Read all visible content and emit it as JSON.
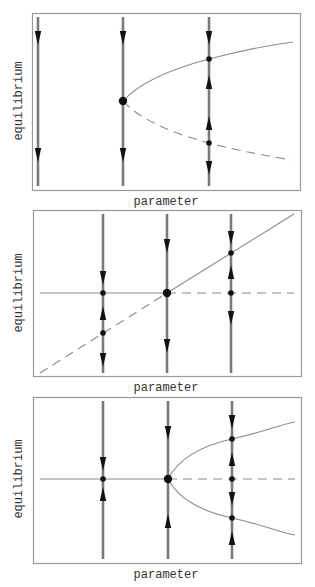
{
  "figure": {
    "colors": {
      "frame": "#9a9a9a",
      "branch": "#8c8c8c",
      "phase_line": "#7a7a7a",
      "arrow": "#111111",
      "dot": "#111111",
      "text": "#333333"
    }
  },
  "panels": [
    {
      "name": "saddle-node",
      "xlabel": "parameter",
      "ylabel": "equilibrium",
      "frame": {
        "x": 32,
        "y": 13,
        "w": 268,
        "h": 177
      },
      "xlabel_pos": {
        "x": 166,
        "y": 205
      },
      "ylabel_pos": {
        "x": 22,
        "y": 101
      },
      "stable_branches": [
        {
          "type": "path",
          "d": "M123,101 C140,82 175,68 209,59 S270,45 293,42"
        }
      ],
      "unstable_branches": [
        {
          "type": "path",
          "d": "M123,101 C140,120 175,134 209,143 S270,156 291,160"
        }
      ],
      "phase_lines": [
        {
          "x": 38,
          "y1": 17,
          "y2": 186,
          "arrows": [
            {
              "y": 38,
              "dir": "down"
            },
            {
              "y": 155,
              "dir": "down"
            }
          ],
          "points": []
        },
        {
          "x": 123,
          "y1": 17,
          "y2": 186,
          "arrows": [
            {
              "y": 38,
              "dir": "down"
            },
            {
              "y": 155,
              "dir": "down"
            }
          ],
          "points": [
            {
              "y": 101,
              "size": "large"
            }
          ]
        },
        {
          "x": 209,
          "y1": 17,
          "y2": 186,
          "arrows": [
            {
              "y": 38,
              "dir": "down"
            },
            {
              "y": 82,
              "dir": "up"
            },
            {
              "y": 123,
              "dir": "up"
            },
            {
              "y": 168,
              "dir": "down"
            }
          ],
          "points": [
            {
              "y": 59,
              "size": "small"
            },
            {
              "y": 143,
              "size": "small"
            }
          ]
        }
      ]
    },
    {
      "name": "transcritical",
      "xlabel": "parameter",
      "ylabel": "equilibrium",
      "frame": {
        "x": 33,
        "y": 210,
        "w": 268,
        "h": 166
      },
      "xlabel_pos": {
        "x": 166,
        "y": 391
      },
      "ylabel_pos": {
        "x": 22,
        "y": 293
      },
      "stable_branches": [
        {
          "type": "line",
          "x1": 40,
          "y1": 293,
          "x2": 167,
          "y2": 293
        },
        {
          "type": "line",
          "x1": 167,
          "y1": 293,
          "x2": 294,
          "y2": 214
        }
      ],
      "unstable_branches": [
        {
          "type": "line",
          "x1": 40,
          "y1": 373,
          "x2": 167,
          "y2": 293
        },
        {
          "type": "line",
          "x1": 167,
          "y1": 293,
          "x2": 294,
          "y2": 293
        }
      ],
      "phase_lines": [
        {
          "x": 103,
          "y1": 214,
          "y2": 373,
          "arrows": [
            {
              "y": 278,
              "dir": "down"
            },
            {
              "y": 313,
              "dir": "up"
            },
            {
              "y": 360,
              "dir": "down"
            }
          ],
          "points": [
            {
              "y": 293,
              "size": "small"
            },
            {
              "y": 333,
              "size": "small"
            }
          ]
        },
        {
          "x": 167,
          "y1": 214,
          "y2": 373,
          "arrows": [
            {
              "y": 246,
              "dir": "down"
            },
            {
              "y": 346,
              "dir": "down"
            }
          ],
          "points": [
            {
              "y": 293,
              "size": "large"
            }
          ]
        },
        {
          "x": 231,
          "y1": 214,
          "y2": 373,
          "arrows": [
            {
              "y": 238,
              "dir": "down"
            },
            {
              "y": 272,
              "dir": "up"
            },
            {
              "y": 318,
              "dir": "down"
            }
          ],
          "points": [
            {
              "y": 253,
              "size": "small"
            },
            {
              "y": 293,
              "size": "small"
            }
          ]
        }
      ]
    },
    {
      "name": "pitchfork",
      "xlabel": "parameter",
      "ylabel": "equilibrium",
      "frame": {
        "x": 33,
        "y": 397,
        "w": 268,
        "h": 166
      },
      "xlabel_pos": {
        "x": 166,
        "y": 578
      },
      "ylabel_pos": {
        "x": 22,
        "y": 479
      },
      "stable_branches": [
        {
          "type": "line",
          "x1": 40,
          "y1": 479,
          "x2": 168,
          "y2": 479
        },
        {
          "type": "path",
          "d": "M168,479 C178,460 200,446 232,439 S275,426 295,422"
        },
        {
          "type": "path",
          "d": "M168,479 C178,498 200,511 232,518 S275,531 295,535"
        }
      ],
      "unstable_branches": [
        {
          "type": "line",
          "x1": 168,
          "y1": 479,
          "x2": 295,
          "y2": 479
        }
      ],
      "phase_lines": [
        {
          "x": 103,
          "y1": 401,
          "y2": 559,
          "arrows": [
            {
              "y": 464,
              "dir": "down"
            },
            {
              "y": 494,
              "dir": "up"
            }
          ],
          "points": [
            {
              "y": 479,
              "size": "small"
            }
          ]
        },
        {
          "x": 168,
          "y1": 401,
          "y2": 559,
          "arrows": [
            {
              "y": 433,
              "dir": "down"
            },
            {
              "y": 521,
              "dir": "up"
            }
          ],
          "points": [
            {
              "y": 479,
              "size": "large"
            }
          ]
        },
        {
          "x": 232,
          "y1": 401,
          "y2": 559,
          "arrows": [
            {
              "y": 422,
              "dir": "down"
            },
            {
              "y": 459,
              "dir": "up"
            },
            {
              "y": 499,
              "dir": "down"
            },
            {
              "y": 538,
              "dir": "up"
            }
          ],
          "points": [
            {
              "y": 439,
              "size": "small"
            },
            {
              "y": 479,
              "size": "small"
            },
            {
              "y": 518,
              "size": "small"
            }
          ]
        }
      ]
    }
  ]
}
